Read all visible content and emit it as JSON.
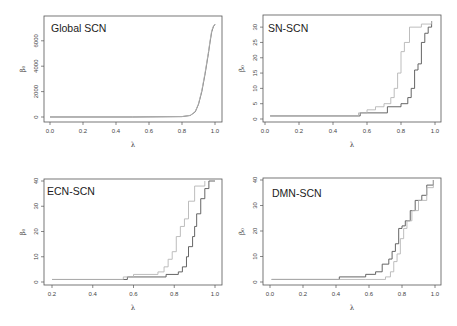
{
  "figure": {
    "panels": [
      {
        "id": "global",
        "title": "Global SCN"
      },
      {
        "id": "sn",
        "title": "SN-SCN"
      },
      {
        "id": "ecn",
        "title": "ECN-SCN"
      },
      {
        "id": "dmn",
        "title": "DMN-SCN"
      }
    ],
    "colors": {
      "series_dark": "#555555",
      "series_light": "#b5b5b5",
      "frame": "#555555"
    }
  },
  "chart_data": [
    {
      "type": "line",
      "title": "Global SCN",
      "xlabel": "λ",
      "ylabel": "β₀",
      "xlim": [
        0,
        1
      ],
      "ylim": [
        0,
        7400
      ],
      "xticks": [
        0.0,
        0.2,
        0.4,
        0.6,
        0.8,
        1.0
      ],
      "yticks": [
        0,
        2000,
        4000,
        6000
      ],
      "grid": false,
      "series": [
        {
          "name": "dark",
          "x": [
            0.0,
            0.5,
            0.8,
            0.85,
            0.88,
            0.9,
            0.92,
            0.94,
            0.96,
            0.97,
            0.98,
            0.99,
            1.0
          ],
          "values": [
            1,
            1,
            30,
            120,
            400,
            1000,
            2000,
            3400,
            5000,
            5900,
            6700,
            7100,
            7300
          ]
        },
        {
          "name": "light",
          "x": [
            0.0,
            0.5,
            0.8,
            0.85,
            0.88,
            0.9,
            0.92,
            0.94,
            0.96,
            0.97,
            0.98,
            0.99,
            1.0
          ],
          "values": [
            1,
            1,
            35,
            130,
            420,
            1050,
            2100,
            3500,
            5100,
            6000,
            6800,
            7150,
            7300
          ]
        }
      ]
    },
    {
      "type": "line",
      "title": "SN-SCN",
      "xlabel": "λ",
      "ylabel": "β₀",
      "xlim": [
        0,
        1
      ],
      "ylim": [
        0,
        32
      ],
      "xticks": [
        0.0,
        0.2,
        0.4,
        0.6,
        0.8,
        1.0
      ],
      "yticks": [
        0,
        5,
        10,
        15,
        20,
        25,
        30
      ],
      "grid": false,
      "series": [
        {
          "name": "dark",
          "x": [
            0.03,
            0.56,
            0.72,
            0.8,
            0.84,
            0.86,
            0.88,
            0.9,
            0.92,
            0.94,
            0.96,
            0.98
          ],
          "values": [
            1,
            2,
            4,
            5,
            7,
            10,
            16,
            18,
            25,
            28,
            30,
            32
          ]
        },
        {
          "name": "light",
          "x": [
            0.03,
            0.55,
            0.6,
            0.65,
            0.7,
            0.74,
            0.76,
            0.78,
            0.8,
            0.82,
            0.85,
            0.92,
            0.98
          ],
          "values": [
            1,
            2,
            3,
            4,
            5,
            7,
            10,
            15,
            22,
            25,
            30,
            31,
            32
          ]
        }
      ]
    },
    {
      "type": "line",
      "title": "ECN-SCN",
      "xlabel": "λ",
      "ylabel": "β₀",
      "xlim": [
        0.2,
        1
      ],
      "ylim": [
        0,
        40
      ],
      "xticks": [
        0.2,
        0.4,
        0.6,
        0.8,
        1.0
      ],
      "yticks": [
        0,
        10,
        20,
        30,
        40
      ],
      "grid": false,
      "series": [
        {
          "name": "dark",
          "x": [
            0.2,
            0.57,
            0.76,
            0.82,
            0.84,
            0.86,
            0.87,
            0.89,
            0.9,
            0.91,
            0.93,
            0.95,
            0.97,
            1.0
          ],
          "values": [
            1,
            2,
            3,
            4,
            6,
            10,
            14,
            18,
            22,
            27,
            33,
            37,
            40,
            40
          ]
        },
        {
          "name": "light",
          "x": [
            0.2,
            0.55,
            0.6,
            0.72,
            0.75,
            0.77,
            0.79,
            0.81,
            0.83,
            0.85,
            0.87,
            0.9,
            0.95
          ],
          "values": [
            1,
            2,
            3,
            4,
            6,
            9,
            12,
            18,
            22,
            25,
            32,
            38,
            40
          ]
        }
      ]
    },
    {
      "type": "line",
      "title": "DMN-SCN",
      "xlabel": "λ",
      "ylabel": "β₀",
      "xlim": [
        0,
        1
      ],
      "ylim": [
        0,
        40
      ],
      "xticks": [
        0.0,
        0.2,
        0.4,
        0.6,
        0.8,
        1.0
      ],
      "yticks": [
        0,
        10,
        20,
        30,
        40
      ],
      "grid": false,
      "series": [
        {
          "name": "dark",
          "x": [
            0.01,
            0.42,
            0.58,
            0.64,
            0.68,
            0.72,
            0.74,
            0.76,
            0.78,
            0.8,
            0.82,
            0.85,
            0.88,
            0.92,
            0.95,
            0.99
          ],
          "values": [
            1,
            2,
            3,
            4,
            7,
            9,
            12,
            15,
            21,
            22,
            24,
            28,
            32,
            34,
            38,
            40
          ]
        },
        {
          "name": "light",
          "x": [
            0.01,
            0.42,
            0.58,
            0.7,
            0.73,
            0.75,
            0.77,
            0.79,
            0.81,
            0.83,
            0.86,
            0.9,
            0.95,
            0.99
          ],
          "values": [
            1,
            1,
            1,
            2,
            4,
            8,
            11,
            17,
            21,
            24,
            28,
            32,
            37,
            40
          ]
        }
      ]
    }
  ]
}
